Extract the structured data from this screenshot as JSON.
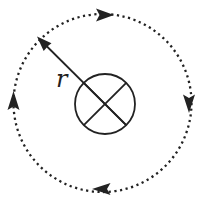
{
  "figure": {
    "type": "circular-motion-diagram",
    "radius_label": "r",
    "orbit_direction": "clockwise",
    "center_symbol": "circled-cross",
    "colors": {
      "ink": "#222222",
      "background": "#ffffff"
    }
  }
}
